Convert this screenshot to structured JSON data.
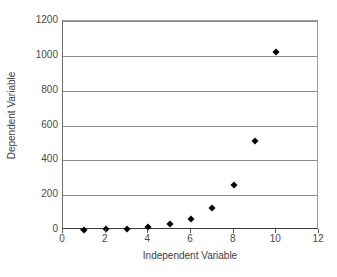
{
  "chart_data": {
    "type": "scatter",
    "title": "",
    "xlabel": "Independent Variable",
    "ylabel": "Dependent Variable",
    "xlim": [
      0,
      12
    ],
    "ylim": [
      0,
      1200
    ],
    "xticks": [
      0,
      2,
      4,
      6,
      8,
      10,
      12
    ],
    "yticks": [
      0,
      200,
      400,
      600,
      800,
      1000,
      1200
    ],
    "xtick_labels": [
      "0",
      "2",
      "4",
      "6",
      "8",
      "10",
      "12"
    ],
    "ytick_labels": [
      "0",
      "200",
      "400",
      "600",
      "800",
      "1000",
      "1200"
    ],
    "grid": "horizontal",
    "legend": "none",
    "marker": "diamond",
    "marker_color": "#000000",
    "gridline_color": "#8c8c8c",
    "background_color": "#ffffff",
    "x": [
      1,
      2,
      3,
      4,
      5,
      6,
      7,
      8,
      9,
      10
    ],
    "values": [
      2,
      4,
      8,
      16,
      32,
      64,
      128,
      256,
      512,
      1024
    ],
    "series": [
      {
        "name": "series-1",
        "points": [
          {
            "x": 1,
            "y": 2
          },
          {
            "x": 2,
            "y": 4
          },
          {
            "x": 3,
            "y": 8
          },
          {
            "x": 4,
            "y": 16
          },
          {
            "x": 5,
            "y": 32
          },
          {
            "x": 6,
            "y": 64
          },
          {
            "x": 7,
            "y": 128
          },
          {
            "x": 8,
            "y": 256
          },
          {
            "x": 9,
            "y": 512
          },
          {
            "x": 10,
            "y": 1024
          }
        ]
      }
    ]
  }
}
